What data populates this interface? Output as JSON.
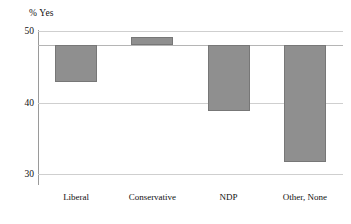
{
  "chart_data": {
    "type": "bar",
    "title": "",
    "subtitle": "",
    "ylabel": "% Yes",
    "xlabel": "",
    "categories": [
      "Liberal",
      "Conservative",
      "NDP",
      "Other, None"
    ],
    "values": [
      42.8,
      49.2,
      38.8,
      31.7
    ],
    "baseline": 48.0,
    "ylim": [
      28.5,
      51.5
    ],
    "yticks": [
      50,
      40,
      30
    ],
    "ytick_labels": [
      "50",
      "40",
      "30"
    ],
    "grid": true,
    "legend": "none",
    "bar_color": "#8f8f8f",
    "bar_edge_color": "#777777",
    "gridline_color": "#cfcfcf",
    "axis_color": "#9a9a9a",
    "note": "Bars are drawn from a common reference level near 48% of Yes responses; Conservative extends above it, the others extend below."
  },
  "axis": {
    "y_title": "% Yes"
  }
}
